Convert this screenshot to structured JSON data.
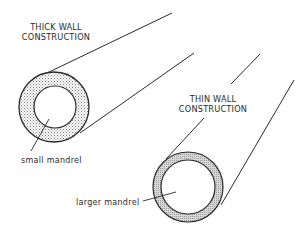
{
  "thick_wall": {
    "title_line1": "THICK WALL",
    "title_line2": "CONSTRUCTION",
    "mandrel_label": "small mandrel"
  },
  "thin_wall": {
    "title_line1": "THIN WALL",
    "title_line2": "CONSTRUCTION",
    "mandrel_label": "larger mandrel"
  },
  "colors": {
    "line": "#2a2a2a",
    "fill_pattern": "#9a9a9a",
    "background": "#ffffff"
  }
}
